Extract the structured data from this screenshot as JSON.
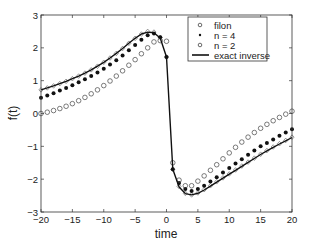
{
  "chart_data": {
    "type": "line",
    "title": "",
    "xlabel": "time",
    "ylabel": "f(t)",
    "xlim": [
      -20,
      20
    ],
    "ylim": [
      -3,
      3
    ],
    "xticks": [
      -20,
      -15,
      -10,
      -5,
      0,
      5,
      10,
      15,
      20
    ],
    "yticks": [
      -3,
      -2,
      -1,
      0,
      1,
      2,
      3
    ],
    "xtick_labels": [
      "−20",
      "−15",
      "−10",
      "−5",
      "0",
      "5",
      "10",
      "15",
      "20"
    ],
    "ytick_labels": [
      "−3",
      "−2",
      "−1",
      "0",
      "1",
      "2",
      "3"
    ],
    "grid": false,
    "legend_position": "upper right",
    "x": [
      -20,
      -19,
      -18,
      -17,
      -16,
      -15,
      -14,
      -13,
      -12,
      -11,
      -10,
      -9,
      -8,
      -7,
      -6,
      -5,
      -4,
      -3,
      -2,
      -1,
      0,
      1,
      2,
      3,
      4,
      5,
      6,
      7,
      8,
      9,
      10,
      11,
      12,
      13,
      14,
      15,
      16,
      17,
      18,
      19,
      20
    ],
    "series": [
      {
        "name": "filon",
        "marker": "diamond-open",
        "values": [
          0.72,
          0.78,
          0.84,
          0.91,
          0.98,
          1.06,
          1.14,
          1.23,
          1.33,
          1.44,
          1.56,
          1.69,
          1.83,
          1.98,
          2.14,
          2.29,
          2.42,
          2.5,
          2.48,
          2.32,
          1.72,
          -1.7,
          -2.22,
          -2.43,
          -2.48,
          -2.42,
          -2.32,
          -2.2,
          -2.08,
          -1.96,
          -1.84,
          -1.72,
          -1.6,
          -1.48,
          -1.36,
          -1.24,
          -1.13,
          -1.02,
          -0.92,
          -0.82,
          -0.72
        ]
      },
      {
        "name": "n = 4",
        "marker": "dot-filled",
        "values": [
          0.48,
          0.55,
          0.62,
          0.7,
          0.78,
          0.86,
          0.95,
          1.04,
          1.14,
          1.25,
          1.36,
          1.49,
          1.62,
          1.77,
          1.93,
          2.09,
          2.25,
          2.38,
          2.44,
          2.32,
          1.72,
          -1.7,
          -2.12,
          -2.3,
          -2.36,
          -2.3,
          -2.2,
          -2.07,
          -1.94,
          -1.8,
          -1.66,
          -1.52,
          -1.39,
          -1.26,
          -1.13,
          -1.0,
          -0.9,
          -0.79,
          -0.68,
          -0.58,
          -0.48
        ]
      },
      {
        "name": "n = 2",
        "marker": "circle-open",
        "values": [
          0.0,
          0.04,
          0.09,
          0.15,
          0.22,
          0.3,
          0.39,
          0.49,
          0.6,
          0.72,
          0.85,
          0.99,
          1.14,
          1.3,
          1.47,
          1.64,
          1.82,
          2.0,
          2.18,
          2.22,
          2.2,
          -1.5,
          -2.03,
          -2.2,
          -2.2,
          -2.06,
          -1.9,
          -1.73,
          -1.56,
          -1.38,
          -1.2,
          -1.03,
          -0.87,
          -0.72,
          -0.58,
          -0.45,
          -0.33,
          -0.22,
          -0.12,
          -0.02,
          0.07
        ]
      },
      {
        "name": "exact inverse",
        "marker": "line-solid",
        "values": [
          0.72,
          0.78,
          0.84,
          0.91,
          0.98,
          1.06,
          1.14,
          1.23,
          1.33,
          1.44,
          1.56,
          1.69,
          1.83,
          1.98,
          2.14,
          2.29,
          2.42,
          2.48,
          2.46,
          2.3,
          1.72,
          -1.7,
          -2.24,
          -2.44,
          -2.48,
          -2.43,
          -2.33,
          -2.21,
          -2.09,
          -1.97,
          -1.85,
          -1.73,
          -1.61,
          -1.49,
          -1.37,
          -1.25,
          -1.14,
          -1.03,
          -0.93,
          -0.83,
          -0.73
        ]
      }
    ]
  },
  "legend": {
    "items": [
      "filon",
      "n = 4",
      "n = 2",
      "exact inverse"
    ]
  },
  "colors": {
    "line": "#111111",
    "marker_open": "#444444",
    "axis": "#333333",
    "background": "#ffffff"
  }
}
